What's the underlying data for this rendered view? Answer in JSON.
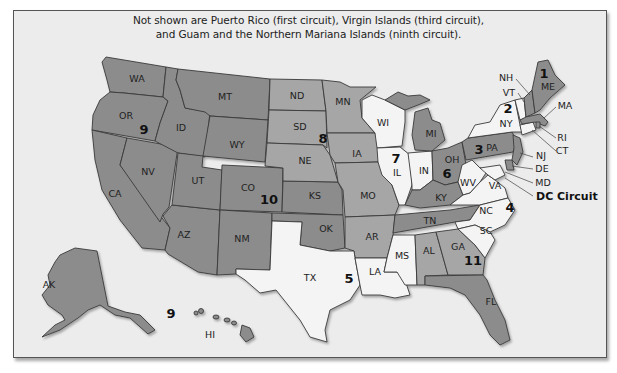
{
  "note": {
    "line1": "Not shown are Puerto Rico (first circuit), Virgin Islands (third circuit),",
    "line2": "and Guam and the Northern Mariana Islands (ninth circuit)."
  },
  "colors": {
    "background": "#ececec",
    "dark_gray": "#8c8c8c",
    "medium_gray": "#a6a6a6",
    "light": "#f4f4f4",
    "border": "#3a3a3a"
  },
  "circuits": [
    {
      "number": "1",
      "states": [
        "ME",
        "NH",
        "MA",
        "RI"
      ]
    },
    {
      "number": "2",
      "states": [
        "NY",
        "VT",
        "CT"
      ]
    },
    {
      "number": "3",
      "states": [
        "PA",
        "NJ",
        "DE"
      ]
    },
    {
      "number": "4",
      "states": [
        "MD",
        "VA",
        "WV",
        "NC",
        "SC"
      ]
    },
    {
      "number": "5",
      "states": [
        "TX",
        "LA",
        "MS"
      ]
    },
    {
      "number": "6",
      "states": [
        "OH",
        "MI",
        "KY",
        "TN"
      ]
    },
    {
      "number": "7",
      "states": [
        "WI",
        "IL",
        "IN"
      ]
    },
    {
      "number": "8",
      "states": [
        "ND",
        "SD",
        "NE",
        "MN",
        "IA",
        "MO",
        "AR"
      ]
    },
    {
      "number": "9",
      "states": [
        "WA",
        "OR",
        "ID",
        "MT",
        "NV",
        "CA",
        "AZ",
        "AK",
        "HI"
      ]
    },
    {
      "number": "10",
      "states": [
        "WY",
        "UT",
        "CO",
        "KS",
        "OK",
        "NM"
      ]
    },
    {
      "number": "11",
      "states": [
        "AL",
        "GA",
        "FL"
      ]
    },
    {
      "number": "DC Circuit",
      "states": [
        "DC"
      ]
    }
  ],
  "state_labels": {
    "WA": "WA",
    "OR": "OR",
    "CA": "CA",
    "NV": "NV",
    "ID": "ID",
    "MT": "MT",
    "WY": "WY",
    "UT": "UT",
    "AZ": "AZ",
    "NM": "NM",
    "CO": "CO",
    "ND": "ND",
    "SD": "SD",
    "NE": "NE",
    "KS": "KS",
    "OK": "OK",
    "TX": "TX",
    "MN": "MN",
    "IA": "IA",
    "MO": "MO",
    "AR": "AR",
    "LA": "LA",
    "MS": "MS",
    "WI": "WI",
    "IL": "IL",
    "IN": "IN",
    "MI": "MI",
    "OH": "OH",
    "KY": "KY",
    "TN": "TN",
    "AL": "AL",
    "GA": "GA",
    "FL": "FL",
    "SC": "SC",
    "NC": "NC",
    "VA": "VA",
    "WV": "WV",
    "PA": "PA",
    "NY": "NY",
    "VT": "VT",
    "NH": "NH",
    "ME": "ME",
    "MA": "MA",
    "RI": "RI",
    "CT": "CT",
    "NJ": "NJ",
    "DE": "DE",
    "MD": "MD",
    "AK": "AK",
    "HI": "HI"
  },
  "circuit_labels": {
    "c1": "1",
    "c2": "2",
    "c3": "3",
    "c4": "4",
    "c5": "5",
    "c6": "6",
    "c7": "7",
    "c8": "8",
    "c9": "9",
    "c9b": "9",
    "c10": "10",
    "c11": "11",
    "dc": "DC Circuit"
  }
}
